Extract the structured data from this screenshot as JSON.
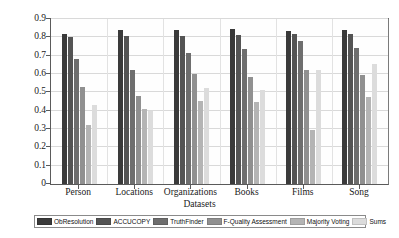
{
  "chart_data": {
    "type": "bar",
    "title": "",
    "xlabel": "Datasets",
    "ylabel": "Accuracy",
    "ylim": [
      0,
      0.9
    ],
    "ytick_labels": [
      "0",
      "0.1",
      "0.2",
      "0.3",
      "0.4",
      "0.5",
      "0.6",
      "0.7",
      "0.8",
      "0.9"
    ],
    "ytick_values": [
      0,
      0.1,
      0.2,
      0.3,
      0.4,
      0.5,
      0.6,
      0.7,
      0.8,
      0.9
    ],
    "grid": true,
    "legend_position": "bottom",
    "categories": [
      "Person",
      "Locations",
      "Organizations",
      "Books",
      "Films",
      "Song"
    ],
    "series": [
      {
        "name": "ObResolution",
        "color": "#3a3a3a",
        "values": [
          0.82,
          0.84,
          0.84,
          0.845,
          0.835,
          0.84
        ]
      },
      {
        "name": "ACCUCOPY",
        "color": "#545454",
        "values": [
          0.8,
          0.81,
          0.81,
          0.815,
          0.82,
          0.82
        ]
      },
      {
        "name": "TruthFinder",
        "color": "#6e6e6e",
        "values": [
          0.68,
          0.62,
          0.715,
          0.735,
          0.78,
          0.74
        ]
      },
      {
        "name": "F-Quality Assessment",
        "color": "#909090",
        "values": [
          0.53,
          0.48,
          0.6,
          0.585,
          0.62,
          0.595
        ]
      },
      {
        "name": "Majority Voting",
        "color": "#b4b4b4",
        "values": [
          0.32,
          0.41,
          0.455,
          0.445,
          0.295,
          0.475
        ]
      },
      {
        "name": "Sums",
        "color": "#dcdcdc",
        "values": [
          0.43,
          0.4,
          0.525,
          0.515,
          0.62,
          0.655
        ]
      }
    ]
  }
}
